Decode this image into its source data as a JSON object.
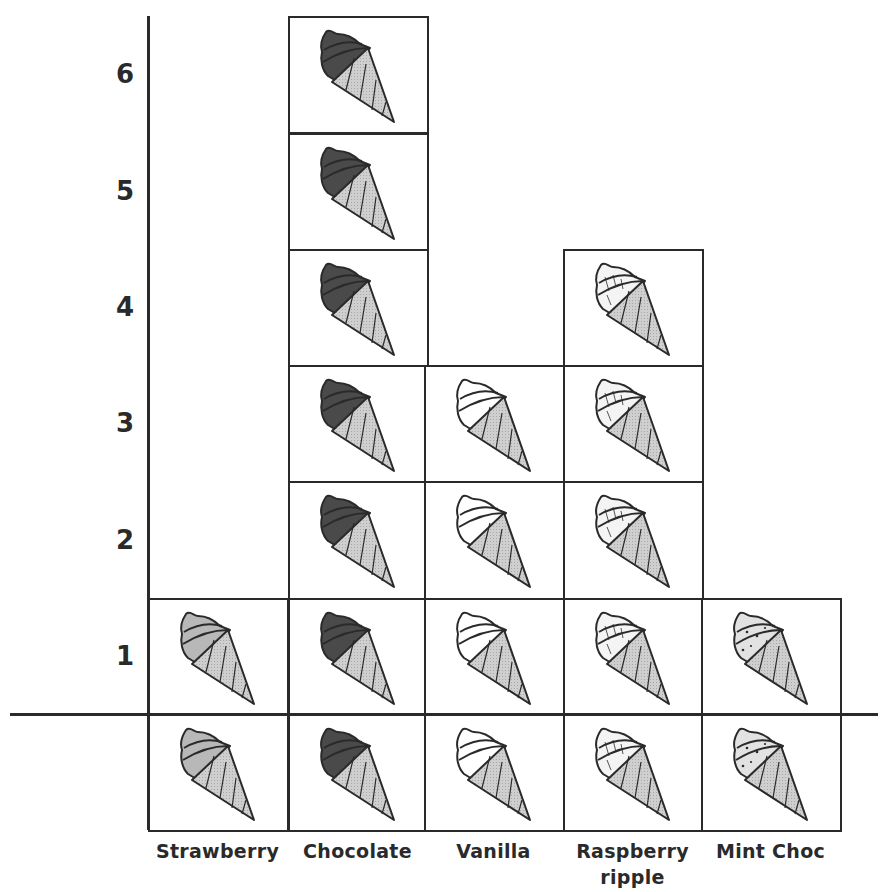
{
  "chart_data": {
    "type": "pictogram",
    "title": "",
    "xlabel": "",
    "ylabel": "",
    "categories": [
      "Strawberry",
      "Chocolate",
      "Vanilla",
      "Raspberry ripple",
      "Mint Choc"
    ],
    "values": [
      1,
      6,
      3,
      4,
      1
    ],
    "yticks": [
      "1",
      "2",
      "3",
      "4",
      "5",
      "6"
    ],
    "ylim": [
      0,
      6
    ],
    "grid": false,
    "legend": "none",
    "note": "Each ice cream cone represents 1; a base row of cones sits below the x-axis under each category as a key",
    "icon": "ice-cream-cone"
  },
  "categories": [
    {
      "label_line1": "Strawberry",
      "label_line2": "",
      "value": 1,
      "scoop_color": "#b8b8b8",
      "pattern": "plain"
    },
    {
      "label_line1": "Chocolate",
      "label_line2": "",
      "value": 6,
      "scoop_color": "#4a4a4a",
      "pattern": "plain"
    },
    {
      "label_line1": "Vanilla",
      "label_line2": "",
      "value": 3,
      "scoop_color": "#ffffff",
      "pattern": "plain"
    },
    {
      "label_line1": "Raspberry",
      "label_line2": "ripple",
      "value": 4,
      "scoop_color": "#f4f4f4",
      "pattern": "ripple"
    },
    {
      "label_line1": "Mint Choc",
      "label_line2": "",
      "value": 1,
      "scoop_color": "#e2e2e2",
      "pattern": "chips"
    }
  ],
  "y_axis": {
    "ticks": [
      "1",
      "2",
      "3",
      "4",
      "5",
      "6"
    ]
  },
  "colors": {
    "line": "#2a2a2a",
    "cone": "#cfcfcf",
    "background": "#ffffff"
  }
}
